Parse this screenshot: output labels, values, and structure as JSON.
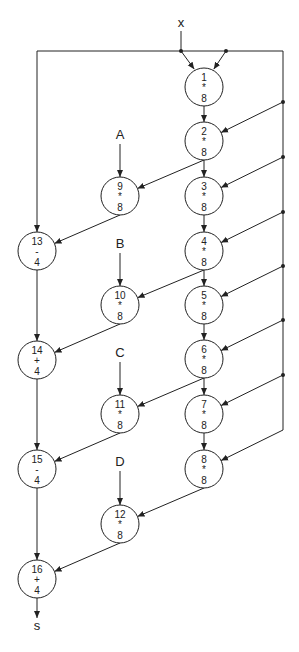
{
  "diagram": {
    "inputs": [
      {
        "id": "x",
        "label": "x",
        "x": 181,
        "y": 27
      },
      {
        "id": "A",
        "label": "A",
        "x": 120,
        "y": 139
      },
      {
        "id": "B",
        "label": "B",
        "x": 120,
        "y": 248
      },
      {
        "id": "C",
        "label": "C",
        "x": 120,
        "y": 357
      },
      {
        "id": "D",
        "label": "D",
        "x": 120,
        "y": 466
      }
    ],
    "output": {
      "id": "s",
      "label": "s",
      "x": 37,
      "y": 630
    },
    "nodes": [
      {
        "id": "1",
        "op": "*",
        "width": "8",
        "x": 204,
        "y": 87
      },
      {
        "id": "2",
        "op": "*",
        "width": "8",
        "x": 204,
        "y": 141
      },
      {
        "id": "3",
        "op": "*",
        "width": "8",
        "x": 204,
        "y": 196
      },
      {
        "id": "4",
        "op": "*",
        "width": "8",
        "x": 204,
        "y": 251
      },
      {
        "id": "5",
        "op": "*",
        "width": "8",
        "x": 204,
        "y": 305
      },
      {
        "id": "6",
        "op": "*",
        "width": "8",
        "x": 204,
        "y": 359
      },
      {
        "id": "7",
        "op": "*",
        "width": "8",
        "x": 204,
        "y": 414
      },
      {
        "id": "8",
        "op": "*",
        "width": "8",
        "x": 204,
        "y": 469
      },
      {
        "id": "9",
        "op": "*",
        "width": "8",
        "x": 120,
        "y": 196
      },
      {
        "id": "10",
        "op": "*",
        "width": "8",
        "x": 120,
        "y": 305
      },
      {
        "id": "11",
        "op": "*",
        "width": "8",
        "x": 120,
        "y": 414
      },
      {
        "id": "12",
        "op": "*",
        "width": "8",
        "x": 120,
        "y": 524
      },
      {
        "id": "13",
        "op": "-",
        "width": "4",
        "x": 37,
        "y": 251
      },
      {
        "id": "14",
        "op": "+",
        "width": "4",
        "x": 37,
        "y": 360
      },
      {
        "id": "15",
        "op": "-",
        "width": "4",
        "x": 37,
        "y": 469
      },
      {
        "id": "16",
        "op": "+",
        "width": "4",
        "x": 37,
        "y": 579
      }
    ],
    "edges": [
      [
        "x",
        "1"
      ],
      [
        "x",
        "1"
      ],
      [
        "1",
        "2"
      ],
      [
        "x",
        "2"
      ],
      [
        "2",
        "3"
      ],
      [
        "x",
        "3"
      ],
      [
        "3",
        "4"
      ],
      [
        "x",
        "4"
      ],
      [
        "4",
        "5"
      ],
      [
        "x",
        "5"
      ],
      [
        "5",
        "6"
      ],
      [
        "x",
        "6"
      ],
      [
        "6",
        "7"
      ],
      [
        "x",
        "7"
      ],
      [
        "7",
        "8"
      ],
      [
        "x",
        "8"
      ],
      [
        "A",
        "9"
      ],
      [
        "2",
        "9"
      ],
      [
        "B",
        "10"
      ],
      [
        "4",
        "10"
      ],
      [
        "C",
        "11"
      ],
      [
        "6",
        "11"
      ],
      [
        "D",
        "12"
      ],
      [
        "8",
        "12"
      ],
      [
        "x",
        "13"
      ],
      [
        "9",
        "13"
      ],
      [
        "13",
        "14"
      ],
      [
        "10",
        "14"
      ],
      [
        "14",
        "15"
      ],
      [
        "11",
        "15"
      ],
      [
        "15",
        "16"
      ],
      [
        "12",
        "16"
      ],
      [
        "16",
        "s"
      ]
    ]
  }
}
